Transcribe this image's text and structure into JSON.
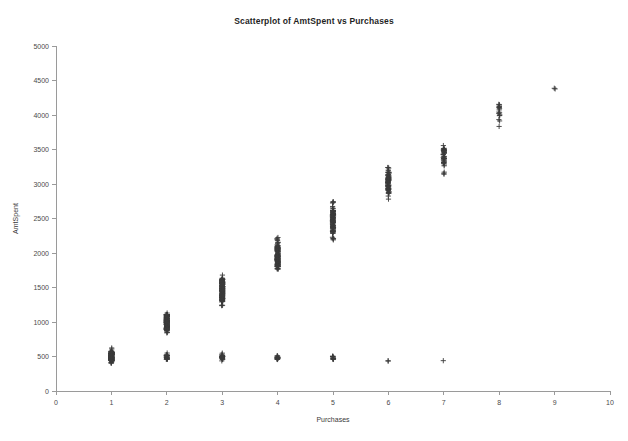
{
  "cropped_header": {
    "fragments": [
      "",
      "",
      "",
      ""
    ]
  },
  "chart_data": {
    "type": "scatter",
    "title": "Scatterplot of AmtSpent vs Purchases",
    "xlabel": "Purchases",
    "ylabel": "AmtSpent",
    "xlim": [
      0,
      10
    ],
    "ylim": [
      0,
      5000
    ],
    "xticks": [
      0,
      1,
      2,
      3,
      4,
      5,
      6,
      7,
      8,
      9,
      10
    ],
    "yticks": [
      0,
      500,
      1000,
      1500,
      2000,
      2500,
      3000,
      3500,
      4000,
      4500,
      5000
    ],
    "xtick_labels": [
      "0",
      "1",
      "2",
      "3",
      "4",
      "5",
      "6",
      "7",
      "8",
      "9",
      "10"
    ],
    "ytick_labels": [
      "0",
      "500",
      "1000",
      "1500",
      "2000",
      "2500",
      "3000",
      "3500",
      "4000",
      "4500",
      "5000"
    ],
    "grid": false,
    "legend": null,
    "marker": "plus",
    "marker_color": "#3b3b3b",
    "series": [
      {
        "name": "AmtSpent vs Purchases",
        "clusters": [
          {
            "x": 1,
            "y_min": 400,
            "y_max": 640,
            "y_dense_min": 440,
            "y_dense_max": 560,
            "n": 180
          },
          {
            "x": 2,
            "y_min": 840,
            "y_max": 1160,
            "y_dense_min": 880,
            "y_dense_max": 1110,
            "n": 170
          },
          {
            "x": 2,
            "y_min": 430,
            "y_max": 560,
            "y_dense_min": 460,
            "y_dense_max": 520,
            "n": 26
          },
          {
            "x": 3,
            "y_min": 1230,
            "y_max": 1720,
            "y_dense_min": 1310,
            "y_dense_max": 1620,
            "n": 160
          },
          {
            "x": 3,
            "y_min": 430,
            "y_max": 560,
            "y_dense_min": 460,
            "y_dense_max": 520,
            "n": 26
          },
          {
            "x": 4,
            "y_min": 1730,
            "y_max": 2230,
            "y_dense_min": 1800,
            "y_dense_max": 2120,
            "n": 140
          },
          {
            "x": 4,
            "y_min": 430,
            "y_max": 540,
            "y_dense_min": 455,
            "y_dense_max": 510,
            "n": 16
          },
          {
            "x": 5,
            "y_min": 2180,
            "y_max": 2760,
            "y_dense_min": 2280,
            "y_dense_max": 2620,
            "n": 110
          },
          {
            "x": 5,
            "y_min": 440,
            "y_max": 530,
            "y_dense_min": 460,
            "y_dense_max": 505,
            "n": 12
          },
          {
            "x": 6,
            "y_min": 2770,
            "y_max": 3290,
            "y_dense_min": 2860,
            "y_dense_max": 3170,
            "n": 80
          },
          {
            "x": 6,
            "y_min": 420,
            "y_max": 445,
            "y_dense_min": 425,
            "y_dense_max": 440,
            "n": 2
          },
          {
            "x": 7,
            "y_min": 3140,
            "y_max": 3560,
            "y_dense_min": 3300,
            "y_dense_max": 3520,
            "n": 45
          },
          {
            "x": 7,
            "y_min": 430,
            "y_max": 450,
            "y_dense_min": 435,
            "y_dense_max": 445,
            "n": 1
          },
          {
            "x": 8,
            "y_min": 3790,
            "y_max": 4200,
            "y_dense_min": 3880,
            "y_dense_max": 4160,
            "n": 18
          },
          {
            "x": 9,
            "y_min": 4370,
            "y_max": 4420,
            "y_dense_min": 4385,
            "y_dense_max": 4400,
            "n": 2
          }
        ],
        "summary_points": [
          {
            "x": 1,
            "y": 500
          },
          {
            "x": 2,
            "y": 1000
          },
          {
            "x": 3,
            "y": 1470
          },
          {
            "x": 4,
            "y": 1960
          },
          {
            "x": 5,
            "y": 2450
          },
          {
            "x": 6,
            "y": 3010
          },
          {
            "x": 7,
            "y": 3420
          },
          {
            "x": 8,
            "y": 4010
          },
          {
            "x": 9,
            "y": 4395
          }
        ]
      }
    ]
  }
}
